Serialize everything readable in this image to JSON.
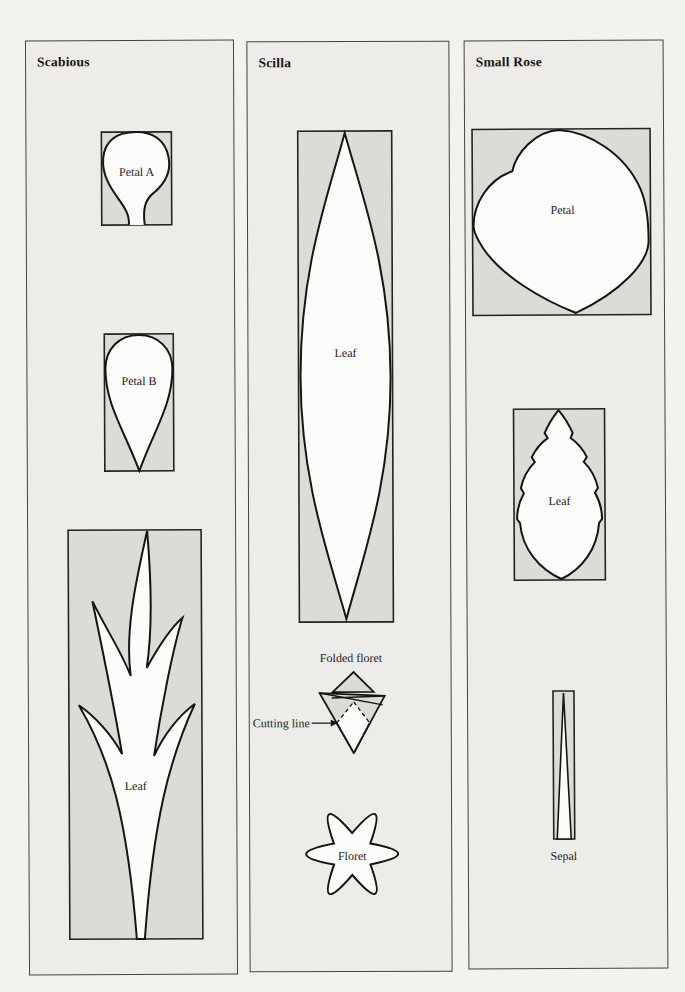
{
  "colors": {
    "page_bg": "#f3f2ee",
    "panel_bg": "#edece8",
    "panel_border": "#45443f",
    "template_box_bg": "#dcdbd6",
    "template_box_border": "#24231f",
    "shape_fill": "#fcfcfa",
    "shape_stroke": "#161510",
    "text": "#24231f"
  },
  "panels": [
    {
      "title": "Scabious",
      "templates": [
        {
          "label": "Petal A"
        },
        {
          "label": "Petal B"
        },
        {
          "label": "Leaf"
        }
      ]
    },
    {
      "title": "Scilla",
      "templates": [
        {
          "label": "Leaf"
        },
        {
          "label": "Folded floret"
        },
        {
          "label": "Cutting line"
        },
        {
          "label": "Floret"
        }
      ]
    },
    {
      "title": "Small Rose",
      "templates": [
        {
          "label": "Petal"
        },
        {
          "label": "Leaf"
        },
        {
          "label": "Sepal"
        }
      ]
    }
  ]
}
